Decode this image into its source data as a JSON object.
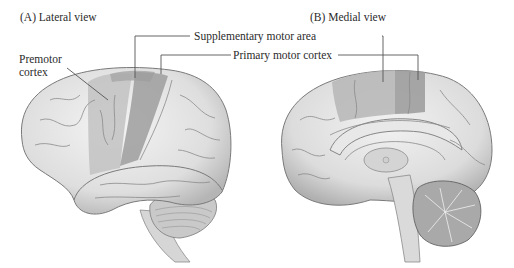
{
  "panels": {
    "a": {
      "title": "(A)  Lateral view"
    },
    "b": {
      "title": "(B)  Medial view"
    }
  },
  "labels": {
    "premotor": [
      "Premotor",
      "cortex"
    ],
    "supplementary": "Supplementary motor area",
    "primary": "Primary motor cortex"
  },
  "colors": {
    "background": "#ffffff",
    "brain_base": "#dcdcdc",
    "brain_light": "#eeeeee",
    "sulci": "#8a8a8a",
    "premotor_shade": "#b8b8b8",
    "primary_shade": "#9a9a9a",
    "leader_line": "#555555"
  }
}
